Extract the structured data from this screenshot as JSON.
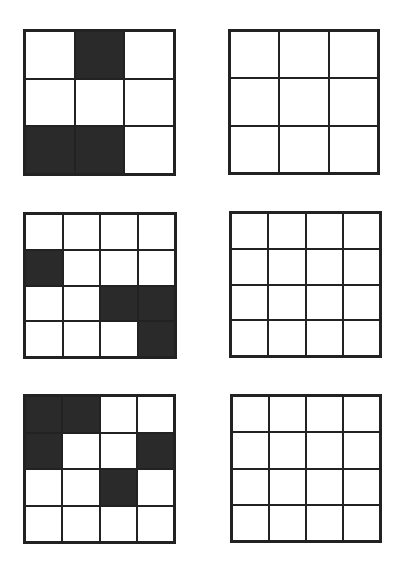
{
  "colors": {
    "line": "#222222",
    "filled": "#2a2a2a",
    "empty": "#ffffff"
  },
  "puzzles": [
    {
      "size": 3,
      "pattern": [
        [
          0,
          1,
          0
        ],
        [
          0,
          0,
          0
        ],
        [
          1,
          1,
          0
        ]
      ],
      "answer_grid": {
        "size": 3,
        "state": "empty"
      }
    },
    {
      "size": 4,
      "pattern": [
        [
          0,
          0,
          0,
          0
        ],
        [
          1,
          0,
          0,
          0
        ],
        [
          0,
          0,
          1,
          1
        ],
        [
          0,
          0,
          0,
          1
        ]
      ],
      "answer_grid": {
        "size": 4,
        "state": "empty"
      }
    },
    {
      "size": 4,
      "pattern": [
        [
          1,
          1,
          0,
          0
        ],
        [
          1,
          0,
          0,
          1
        ],
        [
          0,
          0,
          1,
          0
        ],
        [
          0,
          0,
          0,
          0
        ]
      ],
      "answer_grid": {
        "size": 4,
        "state": "empty"
      }
    }
  ]
}
